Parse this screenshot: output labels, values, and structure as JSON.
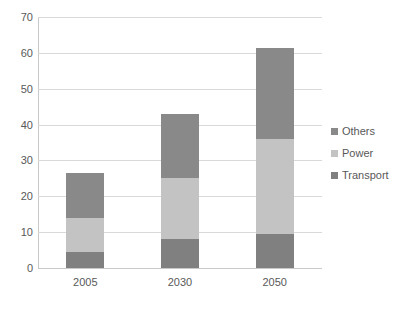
{
  "chart_data": {
    "type": "bar",
    "subtype": "stacked-bar",
    "title": "",
    "subtitle": "",
    "xlabel": "",
    "ylabel": "",
    "categories": [
      "2005",
      "2030",
      "2050"
    ],
    "series": [
      {
        "name": "Transport",
        "values": [
          4.5,
          8,
          9.5
        ],
        "color": "#808080"
      },
      {
        "name": "Power",
        "values": [
          9.5,
          17,
          26.5
        ],
        "color": "#c3c3c3"
      },
      {
        "name": "Others",
        "values": [
          12.5,
          18,
          25.5
        ],
        "color": "#898989"
      }
    ],
    "stack_order_bottom_to_top": [
      "Transport",
      "Power",
      "Others"
    ],
    "totals": [
      26.5,
      43,
      61.5
    ],
    "ylim": [
      0,
      70
    ],
    "ytick_step": 10,
    "yticks": [
      "70",
      "60",
      "50",
      "40",
      "30",
      "20",
      "10",
      "0"
    ],
    "ytick_values": [
      70,
      60,
      50,
      40,
      30,
      20,
      10,
      0
    ],
    "grid": true,
    "grid_axis": "y",
    "legend_position": "right",
    "legend_entries": [
      "Others",
      "Power",
      "Transport"
    ]
  },
  "style": {
    "background": "#ffffff",
    "gridline_color": "#d9d9d9",
    "axis_color": "#c9c9c9",
    "text_color": "#595959"
  }
}
